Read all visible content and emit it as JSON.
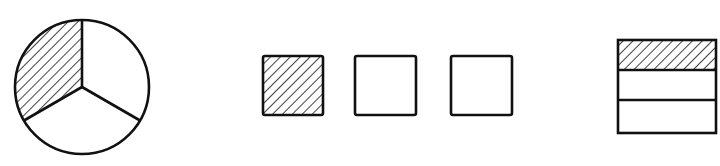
{
  "figure": {
    "stroke_color": "#111111",
    "background": "#ffffff",
    "circle": {
      "parts": 3,
      "shaded_parts": 1,
      "fraction": "1/3"
    },
    "squares": {
      "count": 3,
      "shaded_count": 1,
      "fraction": "1/3"
    },
    "bar": {
      "parts": 3,
      "shaded_parts": 1,
      "fraction": "1/3"
    }
  }
}
